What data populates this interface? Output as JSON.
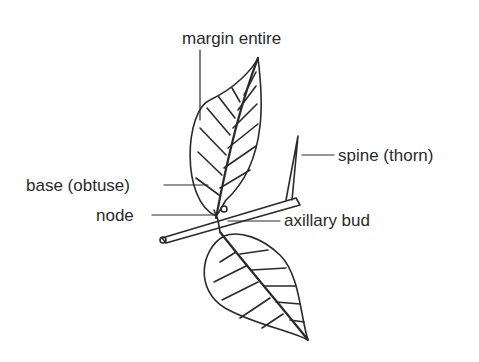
{
  "diagram": {
    "labels": {
      "margin": "margin entire",
      "spine": "spine (thorn)",
      "base": "base (obtuse)",
      "node": "node",
      "bud": "axillary bud"
    },
    "colors": {
      "ink": "#2a2a2a",
      "background": "#ffffff"
    }
  }
}
